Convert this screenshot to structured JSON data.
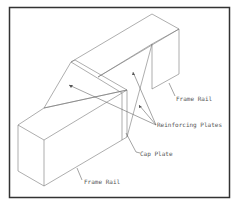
{
  "diagram": {
    "type": "isometric technical drawing",
    "frame": {
      "stroke": "#333333"
    },
    "line_color": "#777777",
    "labels": {
      "frame_rail_upper": "Frame Rail",
      "reinforcing_plates": "Reinforcing Plates",
      "cap_plate": "Cap Plate",
      "frame_rail_lower": "Frame Rail"
    }
  }
}
